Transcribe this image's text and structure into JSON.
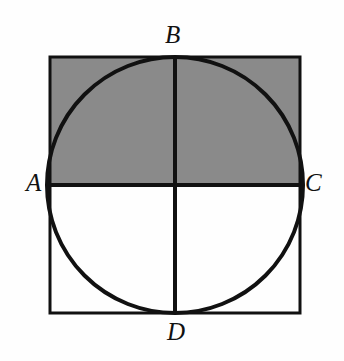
{
  "figure": {
    "background_color": "#fefefe",
    "stroke_color": "#111111",
    "shade_color": "#8a8a8a",
    "labels": {
      "A": "A",
      "B": "B",
      "C": "C",
      "D": "D"
    },
    "icons": {
      "square": "square-outline-icon",
      "circle": "circle-outline-icon",
      "shaded_region": "shaded-rectangle-icon",
      "horizontal_diameter": "horizontal-line-icon",
      "vertical_diameter": "vertical-line-icon"
    }
  },
  "chart_data": {
    "type": "diagram",
    "geometry": {
      "square": {
        "left": 50,
        "top": 57,
        "right": 300,
        "bottom": 313,
        "width": 250,
        "height": 256,
        "stroke_width": 3
      },
      "circle": {
        "cx": 175,
        "cy": 185,
        "r": 128,
        "stroke_width": 4,
        "fill": "none"
      },
      "shaded_region": {
        "shape": "rectangle",
        "left": 50,
        "top": 57,
        "right": 300,
        "bottom": 185,
        "width": 250,
        "height": 128,
        "fill": "#8a8a8a"
      },
      "segment_AC": {
        "x1": 50,
        "y1": 185,
        "x2": 300,
        "y2": 185,
        "stroke_width": 4
      },
      "segment_BD": {
        "x1": 175,
        "y1": 57,
        "x2": 175,
        "y2": 313,
        "stroke_width": 4
      }
    },
    "points": [
      {
        "name": "A",
        "x": 50,
        "y": 185,
        "description": "left tangent point of circle on square left side"
      },
      {
        "name": "B",
        "x": 175,
        "y": 57,
        "description": "top tangent point of circle on square top side"
      },
      {
        "name": "C",
        "x": 300,
        "y": 185,
        "description": "right tangent point of circle on square right side"
      },
      {
        "name": "D",
        "x": 175,
        "y": 313,
        "description": "bottom tangent point of circle on square bottom side"
      }
    ],
    "label_positions": [
      {
        "name": "A",
        "x": 26,
        "y": 170,
        "anchor": "outside-left"
      },
      {
        "name": "B",
        "x": 165,
        "y": 22,
        "anchor": "outside-top"
      },
      {
        "name": "C",
        "x": 305,
        "y": 170,
        "anchor": "outside-right"
      },
      {
        "name": "D",
        "x": 167,
        "y": 319,
        "anchor": "outside-bottom"
      }
    ],
    "legend": [],
    "annotations": []
  }
}
